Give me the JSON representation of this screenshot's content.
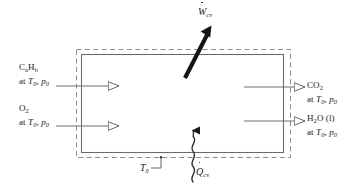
{
  "figure": {
    "kind": "control-volume-energy-balance",
    "background": "#ffffff",
    "line_color": "#6e6e6e",
    "accent_color": "#111111"
  },
  "control_volume": {
    "solid_boundary_label": "control-volume-wall",
    "dashed_boundary_label": "system-boundary-at-T0"
  },
  "inlets": [
    {
      "id": "fuel",
      "species": "C",
      "sub_a": "a",
      "species2": "H",
      "sub_b": "b",
      "state_prefix": "at ",
      "state_T": "T",
      "state_T_sub": "0",
      "state_sep": ", ",
      "state_p": "p",
      "state_p_sub": "0",
      "direction": "in"
    },
    {
      "id": "oxygen",
      "species": "O",
      "sub_a": "2",
      "state_prefix": "at ",
      "state_T": "T",
      "state_T_sub": "0",
      "state_sep": ", ",
      "state_p": "p",
      "state_p_sub": "0",
      "direction": "in"
    }
  ],
  "outlets": [
    {
      "id": "carbon-dioxide",
      "species": "CO",
      "sub_a": "2",
      "state_prefix": "at ",
      "state_T": "T",
      "state_T_sub": "0",
      "state_sep": ", ",
      "state_p": "p",
      "state_p_sub": "0",
      "direction": "out"
    },
    {
      "id": "water-liquid",
      "species": "H",
      "sub_a": "2",
      "species2": "O (l)",
      "state_prefix": "at ",
      "state_T": "T",
      "state_T_sub": "0",
      "state_sep": ", ",
      "state_p": "p",
      "state_p_sub": "0",
      "direction": "out"
    }
  ],
  "work": {
    "symbol": "W",
    "subscript": "cv",
    "dot": true,
    "direction": "out-upward-right"
  },
  "heat": {
    "symbol": "Q",
    "subscript": "cv",
    "dot": true,
    "direction": "in-upward",
    "style": "wavy"
  },
  "ambient": {
    "symbol": "T",
    "subscript": "0"
  }
}
